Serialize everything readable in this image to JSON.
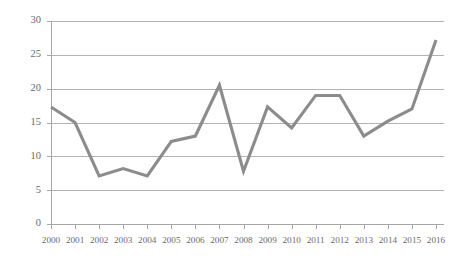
{
  "chart_data": {
    "type": "line",
    "title": "",
    "subtitle": "",
    "xlabel": "",
    "ylabel": "",
    "categories": [
      "2000",
      "2001",
      "2002",
      "2003",
      "2004",
      "2005",
      "2006",
      "2007",
      "2008",
      "2009",
      "2010",
      "2011",
      "2012",
      "2013",
      "2014",
      "2015",
      "2016"
    ],
    "values": [
      17.3,
      15.0,
      7.1,
      8.2,
      7.1,
      12.2,
      13.0,
      20.5,
      7.8,
      17.3,
      14.2,
      19.0,
      19.0,
      13.0,
      15.2,
      17.0,
      27.2
    ],
    "series": [
      {
        "name": "",
        "values": [
          17.3,
          15.0,
          7.1,
          8.2,
          7.1,
          12.2,
          13.0,
          20.5,
          7.8,
          17.3,
          14.2,
          19.0,
          19.0,
          13.0,
          15.2,
          17.0,
          27.2
        ]
      }
    ],
    "ylim": [
      0,
      30
    ],
    "yticks": [
      0,
      5,
      10,
      15,
      20,
      25,
      30
    ],
    "ytick_labels": [
      "0",
      "5",
      "10",
      "15",
      "20",
      "25",
      "30"
    ],
    "xtick_labels": [
      "2000",
      "2001",
      "2002",
      "2003",
      "2004",
      "2005",
      "2006",
      "2007",
      "2008",
      "2009",
      "2010",
      "2011",
      "2012",
      "2013",
      "2014",
      "2015",
      "2016"
    ],
    "grid": true,
    "grid_axis": "y",
    "legend": false,
    "legend_position": "none",
    "annotations": [],
    "colors": {
      "series_line": "#8c8c8c",
      "gridline": "#b3b3b3",
      "axis": "#a6a6a6",
      "tick_label": "#6b6b6b",
      "background": "#ffffff"
    }
  }
}
